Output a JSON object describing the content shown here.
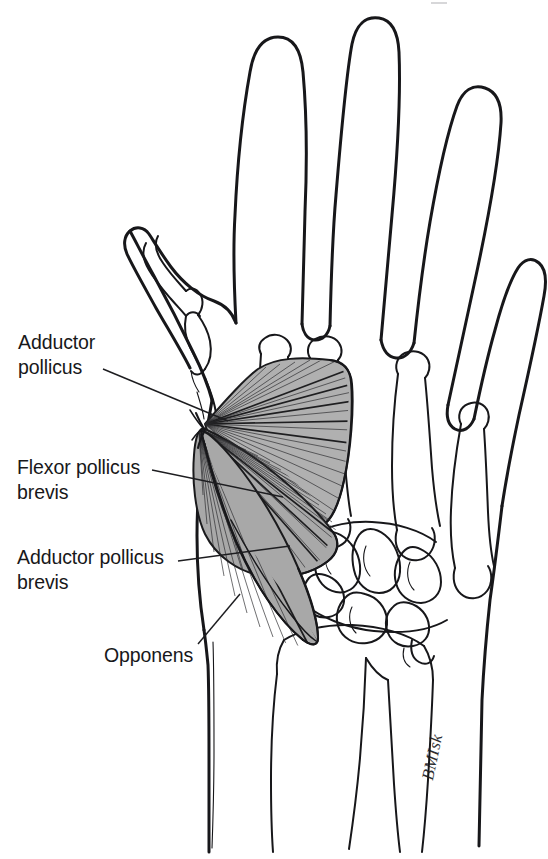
{
  "figure": {
    "kind": "anatomical-line-drawing",
    "background_color": "#ffffff",
    "ink_color": "#17171a",
    "muscle_fill_color": "#b0b0b0",
    "labels": [
      {
        "id": "adductor-pollicus",
        "text": "Adductor\npollicus",
        "x": 18,
        "y": 330,
        "leader_from": [
          103,
          369
        ],
        "leader_to": [
          228,
          421
        ]
      },
      {
        "id": "flexor-pollicus-brevis",
        "text": "Flexor pollicus\nbrevis",
        "x": 17,
        "y": 455,
        "leader_from": [
          152,
          470
        ],
        "leader_to": [
          283,
          497
        ]
      },
      {
        "id": "adductor-pollicus-brevis",
        "text": "Adductor pollicus\nbrevis",
        "x": 17,
        "y": 545,
        "leader_from": [
          178,
          561
        ],
        "leader_to": [
          290,
          546
        ]
      },
      {
        "id": "opponens",
        "text": "Opponens",
        "x": 104,
        "y": 643,
        "leader_from": [
          198,
          644
        ],
        "leader_to": [
          240,
          594
        ]
      }
    ],
    "signature": "BMIsk",
    "muscles": [
      {
        "name": "Adductor pollicus",
        "shape": "fan",
        "shading": "gray with radiating striations"
      },
      {
        "name": "Flexor pollicus brevis",
        "shape": "fan",
        "shading": "gray with radiating striations"
      },
      {
        "name": "Adductor pollicus brevis",
        "shape": "fan",
        "shading": "gray with radiating striations"
      },
      {
        "name": "Opponens",
        "shape": "fan",
        "shading": "gray with radiating striations"
      }
    ],
    "anatomy_parts": [
      "index finger",
      "middle finger",
      "ring finger",
      "little finger",
      "thumb",
      "metacarpals",
      "carpal bones",
      "radius",
      "ulna"
    ]
  }
}
